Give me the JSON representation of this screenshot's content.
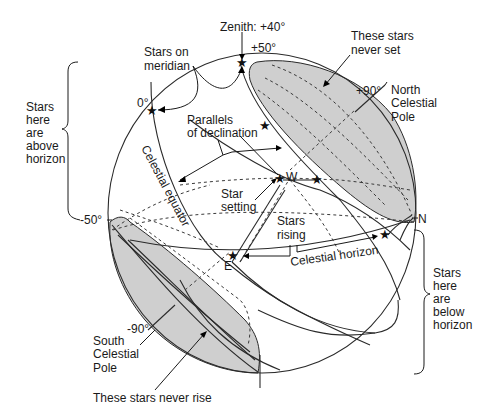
{
  "diagram": {
    "colors": {
      "line": "#2a2a2a",
      "shade": "#cfcfcf",
      "background": "#ffffff"
    },
    "labels": {
      "zenith": "Zenith: +40°",
      "plus50": "+50°",
      "never_set_1": "These stars",
      "never_set_2": "never set",
      "stars_on_meridian_1": "Stars on",
      "stars_on_meridian_2": "meridian",
      "zero_deg": "0°",
      "plus90": "+90°",
      "ncp_1": "North",
      "ncp_2": "Celestial",
      "ncp_3": "Pole",
      "parallels_1": "Parallels",
      "parallels_2": "of declination",
      "celestial_equator": "Celestial equator",
      "west": "W",
      "star_setting_1": "Star",
      "star_setting_2": "setting",
      "stars_rising_1": "Stars",
      "stars_rising_2": "rising",
      "north": "N",
      "east": "E",
      "celestial_horizon": "Celestial horizon",
      "minus50": "-50°",
      "minus90": "-90°",
      "scp_1": "South",
      "scp_2": "Celestial",
      "scp_3": "Pole",
      "never_rise": "These stars never rise",
      "above_1": "Stars",
      "above_2": "here",
      "above_3": "are",
      "above_4": "above",
      "above_5": "horizon",
      "below_1": "Stars",
      "below_2": "here",
      "below_3": "are",
      "below_4": "below",
      "below_5": "horizon"
    },
    "regions": [
      {
        "name": "circumpolar-north",
        "label": "These stars never set",
        "shaded": true
      },
      {
        "name": "circumpolar-south",
        "label": "These stars never rise",
        "shaded": true
      }
    ],
    "stars": [
      {
        "name": "zenith-star",
        "label": "Zenith: +40°"
      },
      {
        "name": "meridian-star-equator",
        "label": "0°"
      },
      {
        "name": "parallel-star",
        "label": ""
      },
      {
        "name": "setting-star",
        "label": "W"
      },
      {
        "name": "star-near-west",
        "label": ""
      },
      {
        "name": "rising-star",
        "label": "E"
      },
      {
        "name": "north-horizon-star",
        "label": ""
      }
    ]
  }
}
